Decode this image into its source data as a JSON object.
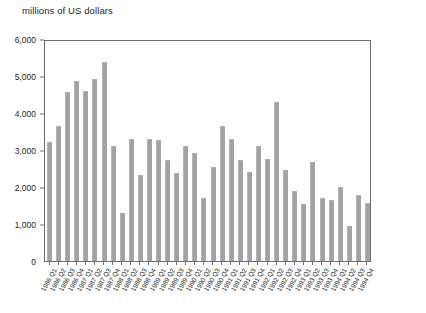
{
  "chart_data": {
    "type": "bar",
    "title": "millions of US dollars",
    "xlabel": "",
    "ylabel": "millions of US dollars",
    "ylim": [
      0,
      6000
    ],
    "ytick_values": [
      0,
      1000,
      2000,
      3000,
      4000,
      5000,
      6000
    ],
    "ytick_labels": [
      "0",
      "1,000",
      "2,000",
      "3,000",
      "4,000",
      "5,000",
      "6,000"
    ],
    "grid": false,
    "legend": "none",
    "bar_color": "#a3a3a3",
    "axis_color": "#6d6e71",
    "categories": [
      "1986 Q1",
      "1986 Q2",
      "1986 Q3",
      "1986 Q4",
      "1987 Q1",
      "1987 Q2",
      "1987 Q3",
      "1987 Q4",
      "1988 Q1",
      "1988 Q2",
      "1988 Q3",
      "1988 Q4",
      "1989 Q1",
      "1989 Q2",
      "1989 Q3",
      "1989 Q4",
      "1990 Q1",
      "1990 Q2",
      "1990 Q3",
      "1990 Q4",
      "1991 Q1",
      "1991 Q2",
      "1991 Q3",
      "1991 Q4",
      "1992 Q1",
      "1992 Q2",
      "1992 Q3",
      "1992 Q4",
      "1993 Q1",
      "1993 Q2",
      "1993 Q3",
      "1993 Q4",
      "1994 Q1",
      "1994 Q2",
      "1994 Q3",
      "1994 Q4"
    ],
    "values": [
      3220,
      3660,
      4580,
      4860,
      4600,
      4930,
      5390,
      3110,
      1300,
      3300,
      2320,
      3300,
      3270,
      2720,
      2380,
      3110,
      2930,
      1690,
      2530,
      3660,
      3300,
      2730,
      2400,
      3120,
      2760,
      4290,
      2450,
      1890,
      1550,
      2670,
      1700,
      1640,
      2010,
      950,
      1790,
      1560
    ],
    "final_value": 2210
  }
}
